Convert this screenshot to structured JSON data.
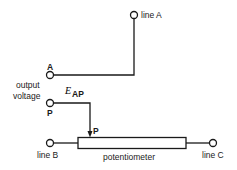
{
  "diagram": {
    "terminals": {
      "line_a": "line A",
      "line_b": "line B",
      "line_c": "line C",
      "a": "A",
      "p": "P",
      "wiper": "P"
    },
    "labels": {
      "output": "output",
      "voltage": "voltage",
      "e_symbol": "E",
      "e_subscript": "AP",
      "potentiometer": "potentiometer"
    },
    "colors": {
      "stroke": "#1a1a1a",
      "background": "#ffffff"
    }
  }
}
